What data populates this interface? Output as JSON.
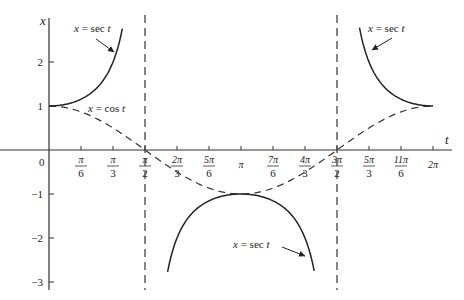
{
  "chart_data": {
    "type": "line",
    "title": "",
    "xlabel": "t",
    "ylabel": "x",
    "xlim": [
      0,
      6.4
    ],
    "ylim": [
      -3.1,
      2.9
    ],
    "grid": false,
    "x_tick_labels": [
      {
        "num": "π",
        "den": "6",
        "value": 0.5236
      },
      {
        "num": "π",
        "den": "3",
        "value": 1.0472
      },
      {
        "num": "π",
        "den": "2",
        "value": 1.5708
      },
      {
        "num": "2π",
        "den": "3",
        "value": 2.0944
      },
      {
        "num": "5π",
        "den": "6",
        "value": 2.618
      },
      {
        "num": "π",
        "den": "",
        "value": 3.1416
      },
      {
        "num": "7π",
        "den": "6",
        "value": 3.6652
      },
      {
        "num": "4π",
        "den": "3",
        "value": 4.1888
      },
      {
        "num": "3π",
        "den": "2",
        "value": 4.7124
      },
      {
        "num": "5π",
        "den": "3",
        "value": 5.236
      },
      {
        "num": "11π",
        "den": "6",
        "value": 5.7596
      },
      {
        "num": "2π",
        "den": "",
        "value": 6.2832
      }
    ],
    "origin_label": "0",
    "y_tick_labels": [
      {
        "label": "2",
        "value": 2
      },
      {
        "label": "1",
        "value": 1
      },
      {
        "label": "−1",
        "value": -1
      },
      {
        "label": "−2",
        "value": -2
      },
      {
        "label": "−3",
        "value": -3
      }
    ],
    "series": [
      {
        "name": "x = cos t",
        "style": "dashed",
        "function": "cos",
        "domain": [
          0,
          6.2832
        ]
      },
      {
        "name": "x = sec t",
        "style": "solid",
        "function": "sec",
        "domain": [
          0,
          1.2
        ],
        "segment": "left"
      },
      {
        "name": "x = sec t",
        "style": "solid",
        "function": "sec",
        "domain": [
          1.94,
          4.34
        ],
        "segment": "middle"
      },
      {
        "name": "x = sec t",
        "style": "solid",
        "function": "sec",
        "domain": [
          5.08,
          6.2832
        ],
        "segment": "right"
      }
    ],
    "asymptotes": [
      {
        "t": 1.5708,
        "label": "t = π/2",
        "style": "dashed"
      },
      {
        "t": 4.7124,
        "label": "t = 3π/2",
        "style": "dashed"
      }
    ],
    "annotations": [
      {
        "text_var": "x",
        "text_eq": "=",
        "text_fn": "sec",
        "text_arg": "t",
        "target": "left sec branch"
      },
      {
        "text_var": "x",
        "text_eq": "=",
        "text_fn": "cos",
        "text_arg": "t",
        "target": "cos curve"
      },
      {
        "text_var": "x",
        "text_eq": "=",
        "text_fn": "sec",
        "text_arg": "t",
        "target": "right sec branch"
      },
      {
        "text_var": "x",
        "text_eq": "=",
        "text_fn": "sec",
        "text_arg": "t",
        "target": "middle sec branch"
      }
    ]
  },
  "labels": {
    "x_axis": "t",
    "y_axis": "x",
    "origin": "0",
    "sec_left": "x = sec t",
    "cos": "x = cos t",
    "sec_right": "x = sec t",
    "sec_mid": "x = sec t"
  }
}
